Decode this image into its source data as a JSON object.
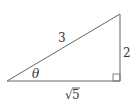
{
  "diagram": {
    "type": "right-triangle",
    "stroke_color": "#666666",
    "label_color": "#333333",
    "labels": {
      "hypotenuse": "3",
      "opposite": "2",
      "adjacent": "5",
      "adjacent_radical": "√",
      "angle": "θ"
    },
    "right_angle_marker": true
  }
}
